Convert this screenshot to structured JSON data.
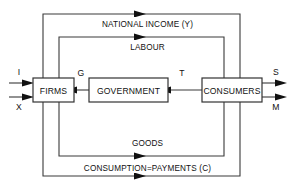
{
  "diagram": {
    "type": "circular-flow-diagram",
    "background_color": "#ffffff",
    "line_color": "#3a3a3a",
    "text_color": "#111111"
  },
  "nodes": [
    {
      "id": "firms",
      "label": "FIRMS"
    },
    {
      "id": "government",
      "label": "GOVERNMENT"
    },
    {
      "id": "consumers",
      "label": "CONSUMERS"
    }
  ],
  "bands": [
    {
      "id": "national-income",
      "label": "NATIONAL INCOME (Y)",
      "direction": "right"
    },
    {
      "id": "labour",
      "label": "LABOUR",
      "direction": "right"
    },
    {
      "id": "goods",
      "label": "GOODS",
      "direction": "right"
    },
    {
      "id": "consumption-payments",
      "label": "CONSUMPTION=PAYMENTS (C)",
      "direction": "right"
    }
  ],
  "flows": [
    {
      "id": "government-spending",
      "label": "G",
      "direction": "left",
      "from": "government",
      "to": "firms"
    },
    {
      "id": "taxes",
      "label": "T",
      "direction": "left",
      "from": "consumers",
      "to": "government"
    }
  ],
  "injections": [
    {
      "id": "investment",
      "label": "I",
      "direction": "right",
      "target": "firms"
    },
    {
      "id": "exports",
      "label": "X",
      "direction": "right",
      "target": "firms"
    }
  ],
  "leakages": [
    {
      "id": "savings",
      "label": "S",
      "direction": "right",
      "source": "consumers"
    },
    {
      "id": "imports",
      "label": "M",
      "direction": "right",
      "source": "consumers"
    }
  ]
}
